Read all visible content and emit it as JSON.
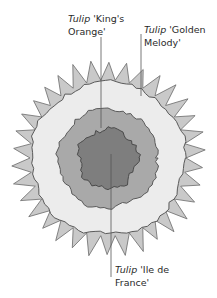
{
  "diagram": {
    "type": "planting-plan",
    "center": {
      "x": 108,
      "y": 158
    },
    "rings": [
      {
        "name": "outer-petal-ring",
        "outer_radius": 97,
        "inner_radius": 78,
        "fill": "#c9c9c9",
        "spikes": 34
      },
      {
        "name": "golden-melody-ring",
        "radius": 77,
        "fill": "#ececec"
      },
      {
        "name": "kings-orange-ring",
        "radius": 50,
        "fill": "#a9a9a9"
      },
      {
        "name": "ile-de-france-center",
        "radius": 30,
        "fill": "#7e7e7e"
      }
    ],
    "outline_color": "#5a5a5a",
    "leader_color": "#555555"
  },
  "labels": [
    {
      "id": "kings-orange",
      "genus": "Tulip",
      "cultivar_line1": "'King's",
      "line2": "Orange'"
    },
    {
      "id": "golden-melody",
      "genus": "Tulip",
      "cultivar_line1": "'Golden",
      "line2": "Melody'"
    },
    {
      "id": "ile-de-france",
      "genus": "Tulip",
      "cultivar_line1": "'Ile de",
      "line2": "France'"
    }
  ]
}
